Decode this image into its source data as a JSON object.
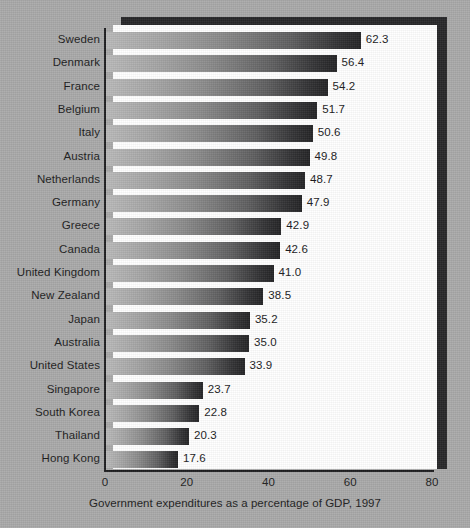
{
  "chart_data": {
    "type": "bar",
    "orientation": "horizontal",
    "title": "",
    "xlabel": "Government expenditures as a percentage of GDP, 1997",
    "ylabel": "",
    "xlim": [
      0,
      80
    ],
    "xticks": [
      0,
      20,
      40,
      60,
      80
    ],
    "xtick_labels": [
      "0",
      "20",
      "40",
      "60",
      "80"
    ],
    "grid": false,
    "legend": null,
    "value_format": "one-decimal",
    "categories": [
      "Sweden",
      "Denmark",
      "France",
      "Belgium",
      "Italy",
      "Austria",
      "Netherlands",
      "Germany",
      "Greece",
      "Canada",
      "United Kingdom",
      "New Zealand",
      "Japan",
      "Australia",
      "United States",
      "Singapore",
      "South Korea",
      "Thailand",
      "Hong Kong"
    ],
    "values": [
      62.3,
      56.4,
      54.2,
      51.7,
      50.6,
      49.8,
      48.7,
      47.9,
      42.9,
      42.6,
      41.0,
      38.5,
      35.2,
      35.0,
      33.9,
      23.7,
      22.8,
      20.3,
      17.6
    ],
    "value_labels": [
      "62.3",
      "56.4",
      "54.2",
      "51.7",
      "50.6",
      "49.8",
      "48.7",
      "47.9",
      "42.9",
      "42.6",
      "41.0",
      "38.5",
      "35.2",
      "35.0",
      "33.9",
      "23.7",
      "22.8",
      "20.3",
      "17.6"
    ],
    "colors": {
      "bar_gradient_start": "#b9b9b9",
      "bar_gradient_end": "#232325",
      "panel_background": "#ffffff",
      "page_background": "#a9a9a9",
      "axis": "#1d1d1f",
      "text": "#1b1b1b",
      "panel_shadow": "#262628"
    }
  }
}
